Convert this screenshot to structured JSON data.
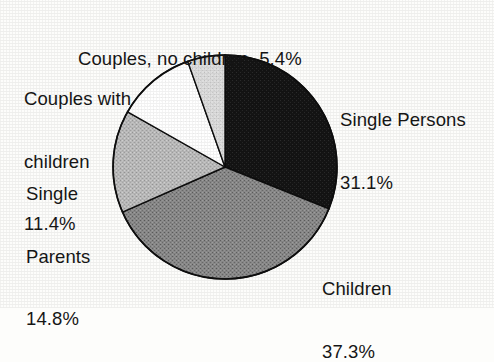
{
  "figure": {
    "background_color": "#fdfdfb",
    "text_color": "#161616",
    "outline_color": "#0e0e0e"
  },
  "pie": {
    "center_x": 225,
    "center_y": 167,
    "radius": 112,
    "start_angle_deg": 0,
    "direction": "clockwise"
  },
  "labels": {
    "couples_no_children": {
      "line1": "Couples, no children  5.4%"
    },
    "couples_with_children": {
      "line1": "Couples with",
      "line2": "children",
      "line3": "11.4%"
    },
    "single_parents": {
      "line1": "Single",
      "line2": "Parents",
      "line3": "14.8%"
    },
    "single_persons": {
      "line1": "Single Persons",
      "line2": "31.1%"
    },
    "children": {
      "line1": "Children",
      "line2": "37.3%"
    }
  },
  "chart_data": {
    "type": "pie",
    "title": "",
    "xlabel": "",
    "ylabel": "",
    "legend_position": "none",
    "grid": false,
    "units": "percent",
    "total": 100.0,
    "start_angle_deg": 90,
    "direction": "clockwise",
    "categories": [
      "Single Persons",
      "Children",
      "Single Parents",
      "Couples with children",
      "Couples, no children"
    ],
    "values": [
      31.1,
      37.3,
      14.8,
      11.4,
      5.4
    ],
    "labels": [
      "Single Persons 31.1%",
      "Children 37.3%",
      "Single Parents 14.8%",
      "Couples with children 11.4%",
      "Couples, no children 5.4%"
    ],
    "colors": [
      "#171717",
      "#7e7e7e",
      "#b2b2b2",
      "#ffffff",
      "#d9d9d9"
    ],
    "slices": [
      {
        "name": "Single Persons",
        "value": 31.1,
        "color": "#171717",
        "fill": "dark-solid"
      },
      {
        "name": "Children",
        "value": 37.3,
        "color": "#7e7e7e",
        "fill": "mid-gray"
      },
      {
        "name": "Single Parents",
        "value": 14.8,
        "color": "#b2b2b2",
        "fill": "light-gray"
      },
      {
        "name": "Couples with children",
        "value": 11.4,
        "color": "#ffffff",
        "fill": "white"
      },
      {
        "name": "Couples, no children",
        "value": 5.4,
        "color": "#d9d9d9",
        "fill": "pale-gray"
      }
    ]
  }
}
